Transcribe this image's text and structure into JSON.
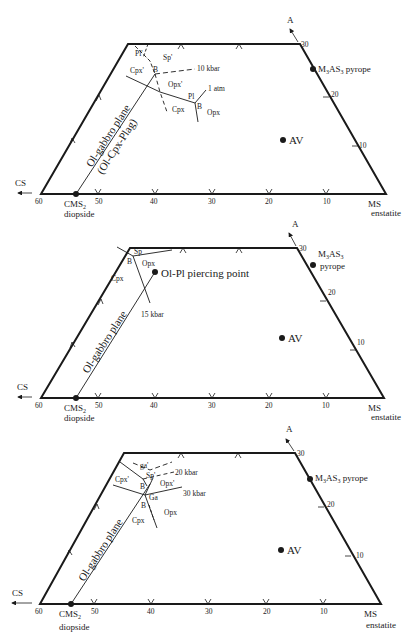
{
  "common": {
    "axis_left": "CS",
    "axis_apex": "A",
    "corner_left_tick": "60",
    "bottom_ticks": [
      "50",
      "40",
      "30",
      "20",
      "10"
    ],
    "right_ticks": [
      "30",
      "20",
      "10"
    ],
    "diopside": {
      "formula": "CMS",
      "sub": "2",
      "name": "diopside"
    },
    "enstatite": {
      "formula": "MS",
      "name": "enstatite"
    },
    "pyrope": {
      "formula": "M",
      "sub1": "3",
      "mid": "AS",
      "sub2": "3",
      "name": "pyrope"
    },
    "av_label": "AV",
    "ink": "#1a1a1a"
  },
  "panels": [
    {
      "plane_label": "Ol-gabbro plane",
      "plane_label2": "(Ol-Cpx-Plag)",
      "labels": {
        "pl_prime": "Pl'",
        "sp_prime": "Sp'",
        "cpx_prime": "Cpx'",
        "b1": "B",
        "p10": "10 kbar",
        "opx_prime": "Opx'",
        "one_atm": "1 atm",
        "pl": "Pl",
        "b2": "B",
        "cpx": "Cpx",
        "opx": "Opx"
      },
      "pyrope_inline": true
    },
    {
      "plane_label": "Ol-gabbro plane",
      "labels": {
        "sp": "Sp",
        "b": "B",
        "opx": "Opx",
        "cpx": "Cpx",
        "p15": "15 kbar",
        "piercing": "Ol-Pl piercing point"
      },
      "pyrope_inline": false
    },
    {
      "plane_label": "Ol-gabbro plane",
      "labels": {
        "ga_prime": "ga'",
        "sp_prime": "Sp'",
        "p20": "20 kbar",
        "cpx_prime": "Cpx'",
        "b1": "B",
        "opx_prime": "Opx'",
        "ga": "Ga",
        "p30": "30 kbar",
        "b2": "B",
        "cpx": "Cpx",
        "opx": "Opx"
      },
      "pyrope_inline": true
    }
  ]
}
